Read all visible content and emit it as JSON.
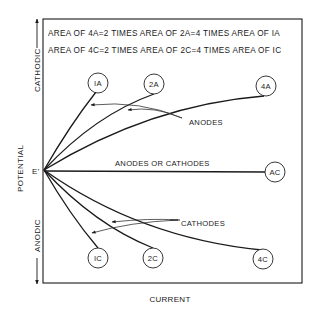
{
  "header": {
    "line1": "AREA OF 4A=2 TIMES  AREA OF 2A=4 TIMES  AREA OF IA",
    "line2": "AREA OF 4C=2 TIMES  AREA OF 2C=4 TIMES  AREA OF IC"
  },
  "axes": {
    "y_label": "POTENTIAL",
    "y_top_label": "CATHODIC",
    "y_bottom_label": "ANODIC",
    "x_label": "CURRENT",
    "origin_label": "E'"
  },
  "annotations": {
    "anodes": "ANODES",
    "cathodes": "CATHODES",
    "anodes_or_cathodes": "ANODES OR CATHODES"
  },
  "curves": {
    "c1A": "IA",
    "c2A": "2A",
    "c4A": "4A",
    "cAC": "AC",
    "c1C": "IC",
    "c2C": "2C",
    "c4C": "4C"
  }
}
